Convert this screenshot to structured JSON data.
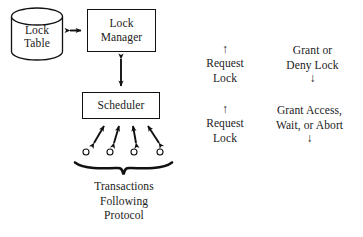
{
  "figure": {
    "ink_color": "#111111",
    "background_color": "#ffffff"
  },
  "nodes": {
    "lock_table": {
      "label_line1": "Lock",
      "label_line2": "Table",
      "shape": "cylinder-icon"
    },
    "lock_manager": {
      "label": "Lock\nManager",
      "label_line1": "Lock",
      "label_line2": "Manager",
      "shape": "rectangle"
    },
    "scheduler": {
      "label": "Scheduler",
      "shape": "rectangle"
    }
  },
  "transactions": {
    "caption_line1": "Transactions",
    "caption_line2": "Following",
    "caption_line3": "Protocol",
    "count": 4
  },
  "connectors": [
    {
      "name": "lock-table-to-lock-manager",
      "style": "double-headed-horizontal-arrow"
    },
    {
      "name": "lock-manager-to-scheduler",
      "style": "double-headed-vertical-arrow"
    },
    {
      "name": "scheduler-to-transactions",
      "style": "double-headed-diagonal-arrow",
      "count": 4
    }
  ],
  "annotations": {
    "request_lock_upper": {
      "arrow": "↑",
      "line1": "Request",
      "line2": "Lock"
    },
    "grant_or_deny_lock": {
      "line1": "Grant or",
      "line2": "Deny Lock",
      "arrow": "↓"
    },
    "request_lock_lower": {
      "arrow": "↑",
      "line1": "Request",
      "line2": "Lock"
    },
    "grant_access_wait_abort": {
      "line1": "Grant Access,",
      "line2": "Wait, or Abort",
      "arrow": "↓"
    }
  }
}
